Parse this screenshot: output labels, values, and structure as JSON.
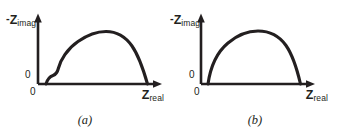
{
  "figure": {
    "background_color": "#ffffff",
    "ink_color": "#231f20",
    "width": 340,
    "height": 132
  },
  "panels": [
    {
      "id": "a",
      "caption": "(a)",
      "y_axis": {
        "minus": "-",
        "variable": "Z",
        "subscript": "imag",
        "origin_tick": "0"
      },
      "x_axis": {
        "variable": "Z",
        "subscript": "real",
        "origin_tick": "0"
      },
      "curve_path": "M 46,84 C 47.5,79 50,76.5 53,75.5 C 56,74.5 57.5,72 58.5,68 C 60.5,60 67,49 78,41.5 C 88,34.5 98,31.5 106,31.5 C 116,31.5 125,36 132,46 C 139,56 143.5,70 147.5,84"
    },
    {
      "id": "b",
      "caption": "(b)",
      "y_axis": {
        "minus": "-",
        "variable": "Z",
        "subscript": "imag",
        "origin_tick": "0"
      },
      "x_axis": {
        "variable": "Z",
        "subscript": "real",
        "origin_tick": "0"
      },
      "curve_path": "M 38,84 C 40,70 46,53 58,43 C 68,34.5 79,31 88,31 C 99,31 109,35.5 116,45.5 C 123,55.5 127,69 130.5,84"
    }
  ],
  "chart_data": {
    "type": "line",
    "title": "",
    "xlabel": "Z_real",
    "ylabel": "-Z_imag",
    "grid": false,
    "legend": "none",
    "axis_ticks": {
      "x": [
        "0"
      ],
      "y": [
        "0"
      ]
    },
    "series": [
      {
        "name": "(a) depressed arc with low-frequency shoulder",
        "panel": "a",
        "shape": "single depressed semicircle preceded by a small shoulder near the origin",
        "x": [
          0.04,
          0.07,
          0.1,
          0.14,
          0.2,
          0.3,
          0.42,
          0.55,
          0.66,
          0.78,
          0.88,
          0.95,
          1.0
        ],
        "y": [
          0.0,
          0.07,
          0.13,
          0.22,
          0.38,
          0.58,
          0.78,
          0.92,
          0.98,
          0.92,
          0.74,
          0.48,
          0.0
        ]
      },
      {
        "name": "(b) single symmetric depressed semicircle",
        "panel": "b",
        "shape": "single smooth depressed semicircle",
        "x": [
          0.0,
          0.06,
          0.14,
          0.24,
          0.36,
          0.48,
          0.58,
          0.68,
          0.78,
          0.88,
          0.95,
          1.0
        ],
        "y": [
          0.0,
          0.22,
          0.44,
          0.64,
          0.82,
          0.94,
          1.0,
          0.98,
          0.88,
          0.68,
          0.42,
          0.0
        ]
      }
    ]
  }
}
